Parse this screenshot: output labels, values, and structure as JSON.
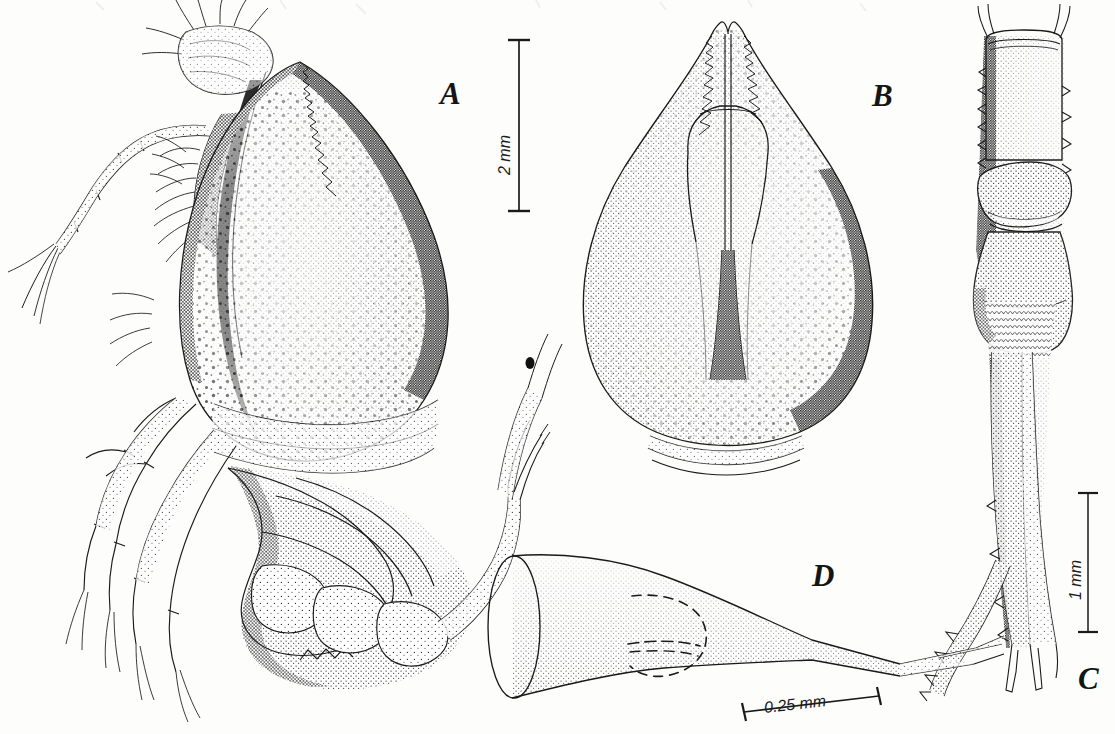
{
  "plate": {
    "kind": "scientific-illustration-plate",
    "medium": "pen-and-ink stipple drawing",
    "background_color": "#fdfdfc",
    "ink_color": "#151515",
    "width": 1115,
    "height": 734,
    "caption": ""
  },
  "panels": [
    {
      "id": "A",
      "label": "A",
      "label_x": 440,
      "label_y": 78,
      "name": "lateral-whole-animal",
      "description": "Entire animal in lateral view: inflated stippled carapace, antennae and antennules with plumose setae, thoracic legs, and curved segmented abdomen ending in telson"
    },
    {
      "id": "B",
      "label": "B",
      "label_x": 872,
      "label_y": 80,
      "name": "dorsal-carapace",
      "description": "Carapace in dorsal view with pointed rostrum, median carina, paired cardiac-region grooves and dense tubercle stippling"
    },
    {
      "id": "C",
      "label": "C",
      "label_x": 1078,
      "label_y": 663,
      "name": "telson-and-uropods",
      "description": "Telson and uropods in dorsal view, with marginal spines and scaly ornamentation"
    },
    {
      "id": "D",
      "label": "D",
      "label_x": 812,
      "label_y": 560,
      "name": "appendage-detail",
      "description": "Funnel-shaped appendage segment drawn to larger scale, with dashed internal outline and bifid distal tip"
    }
  ],
  "scale_bars": [
    {
      "id": "scale-2mm",
      "label": "2 mm",
      "applies_to": "A",
      "orientation": "vertical",
      "x": 519,
      "y_top": 39,
      "y_bottom": 212,
      "length_px": 173,
      "label_x": 497,
      "label_y": 175
    },
    {
      "id": "scale-1mm",
      "label": "1 mm",
      "applies_to": "C",
      "orientation": "vertical",
      "x": 1088,
      "y_top": 492,
      "y_bottom": 633,
      "length_px": 141,
      "label_x": 1068,
      "label_y": 600
    },
    {
      "id": "scale-025mm",
      "label": "0.25 mm",
      "applies_to": "D",
      "orientation": "horizontal-tilted",
      "x_left": 744,
      "y_left": 712,
      "x_right": 879,
      "y_right": 696,
      "length_px": 136,
      "label_x": 765,
      "label_y": 700
    }
  ]
}
